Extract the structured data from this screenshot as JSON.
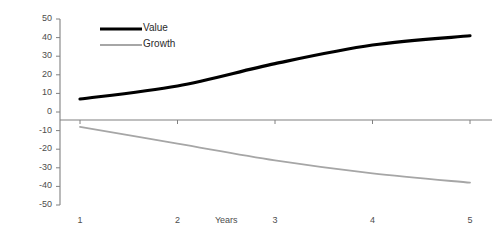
{
  "chart_data": {
    "type": "line",
    "title": "",
    "subtitle": "",
    "xlabel": "Years",
    "ylabel": "",
    "categories": [
      "1",
      "2",
      "3",
      "4",
      "5"
    ],
    "x": [
      1,
      2,
      3,
      4,
      5
    ],
    "series": [
      {
        "name": "Value",
        "values": [
          7,
          14,
          26,
          36,
          41
        ],
        "color": "#000000",
        "line_width": 3.2
      },
      {
        "name": "Growth",
        "values": [
          -8,
          -17,
          -26,
          -33,
          -38
        ],
        "color": "#a6a6a6",
        "line_width": 1.8
      }
    ],
    "ylim": [
      -50,
      50
    ],
    "ytick_step": 10,
    "ytick_labels": [
      "50",
      "40",
      "30",
      "20",
      "10",
      "0",
      "-10",
      "-20",
      "-30",
      "-40",
      "-50"
    ],
    "grid": false,
    "legend_position": "top-left-inside",
    "axis_color": "#808080",
    "zero_line_color": "#808080",
    "background": "#ffffff"
  },
  "legend": {
    "entries": [
      {
        "label": "Value"
      },
      {
        "label": "Growth"
      }
    ]
  },
  "axes": {
    "x_title": "Years"
  }
}
